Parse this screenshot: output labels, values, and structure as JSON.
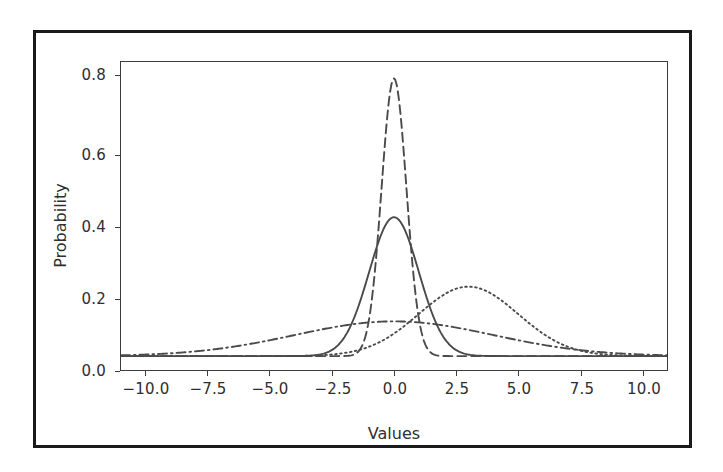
{
  "figure": {
    "background_color": "#ffffff",
    "border_color": "#1a1a1a",
    "axis_color": "#3c3c3c",
    "curve_color": "#4a4a4a"
  },
  "axis": {
    "xlabel": "Values",
    "ylabel": "Probability",
    "xticks": [
      "−10.0",
      "−7.5",
      "−5.0",
      "−2.5",
      "0.0",
      "2.5",
      "5.0",
      "7.5",
      "10.0"
    ],
    "yticks": [
      "0.0",
      "0.2",
      "0.4",
      "0.6",
      "0.8"
    ]
  },
  "chart_data": {
    "type": "line",
    "title": "",
    "xlabel": "Values",
    "ylabel": "Probability",
    "xlim": [
      -11.0,
      11.0
    ],
    "ylim": [
      -0.04,
      0.845
    ],
    "xticks": [
      -10.0,
      -7.5,
      -5.0,
      -2.5,
      0.0,
      2.5,
      5.0,
      7.5,
      10.0
    ],
    "yticks": [
      0.0,
      0.2,
      0.4,
      0.6,
      0.8
    ],
    "grid": false,
    "legend": "none",
    "x": [
      -11,
      -10.5,
      -10,
      -9.5,
      -9,
      -8.5,
      -8,
      -7.5,
      -7,
      -6.5,
      -6,
      -5.5,
      -5,
      -4.5,
      -4,
      -3.5,
      -3,
      -2.5,
      -2,
      -1.75,
      -1.5,
      -1.25,
      -1,
      -0.75,
      -0.5,
      -0.25,
      0,
      0.25,
      0.5,
      0.75,
      1,
      1.25,
      1.5,
      1.75,
      2,
      2.5,
      3,
      3.5,
      4,
      4.5,
      5,
      5.5,
      6,
      6.5,
      7,
      7.5,
      8,
      8.5,
      9,
      9.5,
      10,
      10.5,
      11
    ],
    "series": [
      {
        "name": "normal mu=0 sigma=1",
        "linestyle": "solid",
        "mu": 0.0,
        "sigma": 1.0,
        "peak": 0.399,
        "values": [
          0.0,
          0.0,
          0.0,
          0.0,
          0.0,
          0.0,
          0.0,
          0.0,
          0.0,
          0.0,
          0.0,
          0.0,
          0.0,
          0.0,
          0.0001,
          0.0009,
          0.0044,
          0.0175,
          0.054,
          0.0863,
          0.1295,
          0.1826,
          0.242,
          0.3011,
          0.3521,
          0.3867,
          0.3989,
          0.3867,
          0.3521,
          0.3011,
          0.242,
          0.1826,
          0.1295,
          0.0863,
          0.054,
          0.0175,
          0.0044,
          0.0009,
          0.0001,
          0.0,
          0.0,
          0.0,
          0.0,
          0.0,
          0.0,
          0.0,
          0.0,
          0.0,
          0.0,
          0.0,
          0.0,
          0.0,
          0.0
        ]
      },
      {
        "name": "normal mu=0 sigma=0.5",
        "linestyle": "dashed",
        "mu": 0.0,
        "sigma": 0.5,
        "peak": 0.798,
        "values": [
          0.0,
          0.0,
          0.0,
          0.0,
          0.0,
          0.0,
          0.0,
          0.0,
          0.0,
          0.0,
          0.0,
          0.0,
          0.0,
          0.0,
          0.0,
          0.0,
          0.0,
          0.0,
          0.0003,
          0.0022,
          0.0089,
          0.0293,
          0.108,
          0.2218,
          0.4839,
          0.7041,
          0.7979,
          0.7041,
          0.4839,
          0.2218,
          0.108,
          0.0293,
          0.0089,
          0.0022,
          0.0003,
          0.0,
          0.0,
          0.0,
          0.0,
          0.0,
          0.0,
          0.0,
          0.0,
          0.0,
          0.0,
          0.0,
          0.0,
          0.0,
          0.0,
          0.0,
          0.0,
          0.0,
          0.0
        ]
      },
      {
        "name": "normal mu=3 sigma=2",
        "linestyle": "dotted",
        "mu": 3.0,
        "sigma": 2.0,
        "peak": 0.199,
        "values": [
          0.0,
          0.0,
          0.0,
          0.0,
          0.0,
          0.0,
          0.0,
          0.0,
          0.0,
          0.0,
          0.0,
          0.0,
          0.0001,
          0.0002,
          0.0005,
          0.0013,
          0.0033,
          0.0071,
          0.0132,
          0.0174,
          0.0224,
          0.0283,
          0.035,
          0.0424,
          0.0506,
          0.0593,
          0.0684,
          0.0777,
          0.0872,
          0.0965,
          0.1054,
          0.1138,
          0.1214,
          0.128,
          0.1336,
          0.1413,
          0.1995,
          0.1995,
          0.1933,
          0.1826,
          0.168,
          0.1506,
          0.1315,
          0.112,
          0.093,
          0.0753,
          0.0596,
          0.046,
          0.0346,
          0.0254,
          0.0183,
          0.0128,
          0.0088
        ]
      },
      {
        "name": "normal mu=0 sigma=4",
        "linestyle": "dashdot",
        "mu": 0.0,
        "sigma": 4.0,
        "peak": 0.1,
        "values": [
          0.0093,
          0.0116,
          0.014,
          0.0166,
          0.0194,
          0.0223,
          0.0252,
          0.0281,
          0.031,
          0.0337,
          0.0363,
          0.0387,
          0.0409,
          0.0428,
          0.0443,
          0.0456,
          0.0465,
          0.0471,
          0.0477,
          0.0479,
          0.0481,
          0.0483,
          0.0485,
          0.0486,
          0.0487,
          0.0488,
          0.0997,
          0.0488,
          0.0487,
          0.0486,
          0.0485,
          0.0483,
          0.0481,
          0.0479,
          0.0477,
          0.0471,
          0.0465,
          0.0456,
          0.0443,
          0.0428,
          0.0409,
          0.0387,
          0.0363,
          0.0337,
          0.031,
          0.0281,
          0.0252,
          0.0223,
          0.0194,
          0.0166,
          0.014,
          0.0116,
          0.0093
        ]
      }
    ]
  }
}
